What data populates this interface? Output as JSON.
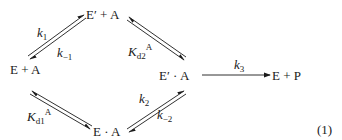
{
  "species": {
    "e_prime_plus_a": "E′ + A",
    "e_plus_a": "E + A",
    "e_prime_dot_a": "E′ · A",
    "e_dot_a": "E · A",
    "e_plus_p": "E + P"
  },
  "rate_constants": {
    "k1": {
      "base": "k",
      "sub": "1"
    },
    "k_minus_1": {
      "base": "k",
      "sub": "−1"
    },
    "kd2A": {
      "base": "K",
      "sub": "d2",
      "sup": "A"
    },
    "kd1A": {
      "base": "K",
      "sub": "d1",
      "sup": "A"
    },
    "k2": {
      "base": "k",
      "sub": "2"
    },
    "k_minus_2": {
      "base": "k",
      "sub": "−2"
    },
    "k3": {
      "base": "k",
      "sub": "3"
    }
  },
  "equation_number": "(1)"
}
